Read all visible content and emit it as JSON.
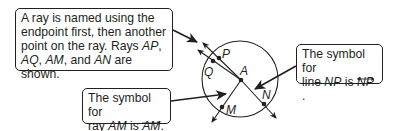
{
  "callouts": {
    "ray_naming": {
      "line1": "A ray is named using the",
      "line2": "endpoint first, then another",
      "line3_prefix": "point on the ray. Rays ",
      "ray1": "AP",
      "ray1_suffix": ",",
      "ray2": "AQ",
      "sep1": ", ",
      "ray3": "AM",
      "sep2": ", and ",
      "ray4": "AN",
      "line4_suffix": " are shown."
    },
    "line_symbol": {
      "line1": "The symbol for",
      "line2_prefix": "line ",
      "name": "NP",
      "is": " is ",
      "symbol": "NP",
      "period": "."
    },
    "ray_symbol": {
      "line1": "The symbol for",
      "line2_prefix": "ray ",
      "name": "AM",
      "is": " is ",
      "symbol": "AM",
      "period": "."
    }
  },
  "figure": {
    "circle": {
      "cx": 240,
      "cy": 79,
      "r": 38
    },
    "points": [
      {
        "name": "P",
        "x": 219,
        "y": 58
      },
      {
        "name": "Q",
        "x": 213,
        "y": 61
      },
      {
        "name": "A",
        "x": 241,
        "y": 80
      },
      {
        "name": "N",
        "x": 264,
        "y": 104
      },
      {
        "name": "M",
        "x": 222,
        "y": 107
      }
    ],
    "labels": {
      "P": "P",
      "Q": "Q",
      "A": "A",
      "N": "N",
      "M": "M"
    },
    "stroke_color": "#231f20"
  }
}
